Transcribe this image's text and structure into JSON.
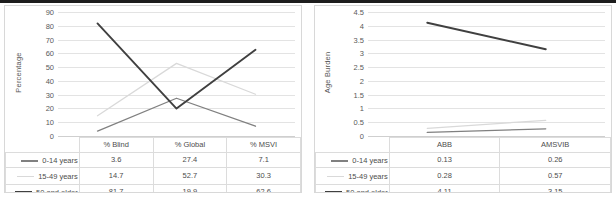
{
  "figure": {
    "panel_count": 2,
    "colors": {
      "series_0_14": "#808080",
      "series_15_49": "#d9d9d9",
      "series_50_plus": "#404040",
      "gridline": "#e3e3e3",
      "text": "#4d4d4d"
    }
  },
  "left_panel": {
    "axis_title": "Percentage",
    "y_ticks": [
      "90",
      "80",
      "70",
      "60",
      "50",
      "40",
      "30",
      "20",
      "10",
      "0"
    ],
    "table": {
      "corner_label": "",
      "columns": [
        "% Blind",
        "% Global",
        "% MSVI"
      ],
      "rows": [
        {
          "label": "0-14 years",
          "values": [
            "3.6",
            "27.4",
            "7.1"
          ]
        },
        {
          "label": "15-49 years",
          "values": [
            "14.7",
            "52.7",
            "30.3"
          ]
        },
        {
          "label": "50 and older",
          "values": [
            "81.7",
            "19.9",
            "62.6"
          ]
        }
      ]
    }
  },
  "right_panel": {
    "axis_title": "Age Burden",
    "y_ticks": [
      "4.5",
      "4",
      "3.5",
      "3",
      "2.5",
      "2",
      "1.5",
      "1",
      "0.5",
      "0"
    ],
    "table": {
      "corner_label": "",
      "columns": [
        "ABB",
        "AMSVIB"
      ],
      "rows": [
        {
          "label": "0-14 years",
          "values": [
            "0.13",
            "0.26"
          ]
        },
        {
          "label": "15-49 years",
          "values": [
            "0.28",
            "0.57"
          ]
        },
        {
          "label": "50 and older",
          "values": [
            "4.11",
            "3.15"
          ]
        }
      ]
    }
  },
  "chart_data": [
    {
      "type": "line",
      "title": "",
      "xlabel": "",
      "ylabel": "Percentage",
      "categories": [
        "% Blind",
        "% Global",
        "% MSVI"
      ],
      "ylim": [
        0,
        90
      ],
      "ytick_step": 10,
      "grid": true,
      "legend_position": "table-left",
      "series": [
        {
          "name": "0-14 years",
          "values": [
            3.6,
            27.4,
            7.1
          ],
          "color": "#808080"
        },
        {
          "name": "15-49 years",
          "values": [
            14.7,
            52.7,
            30.3
          ],
          "color": "#d9d9d9"
        },
        {
          "name": "50 and older",
          "values": [
            81.7,
            19.9,
            62.6
          ],
          "color": "#404040"
        }
      ]
    },
    {
      "type": "line",
      "title": "",
      "xlabel": "",
      "ylabel": "Age Burden",
      "categories": [
        "ABB",
        "AMSVIB"
      ],
      "ylim": [
        0,
        4.5
      ],
      "ytick_step": 0.5,
      "grid": true,
      "legend_position": "table-left",
      "series": [
        {
          "name": "0-14 years",
          "values": [
            0.13,
            0.26
          ],
          "color": "#808080"
        },
        {
          "name": "15-49 years",
          "values": [
            0.28,
            0.57
          ],
          "color": "#d9d9d9"
        },
        {
          "name": "50 and older",
          "values": [
            4.11,
            3.15
          ],
          "color": "#404040"
        }
      ]
    }
  ]
}
